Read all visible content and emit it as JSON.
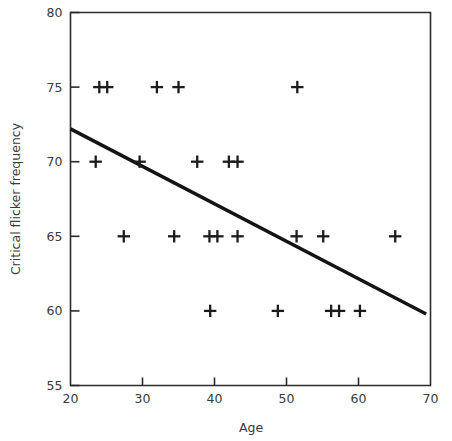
{
  "chart_data": {
    "type": "scatter",
    "title": "",
    "xlabel": "Age",
    "ylabel": "Critical flicker frequency",
    "xlim": [
      20,
      70
    ],
    "ylim": [
      55,
      80
    ],
    "xticks": [
      20,
      30,
      40,
      50,
      60,
      70
    ],
    "xtick_labels": [
      "20",
      "30",
      "40",
      "50",
      "60",
      "70"
    ],
    "yticks": [
      55,
      60,
      65,
      70,
      75,
      80
    ],
    "ytick_labels": [
      "55",
      "60",
      "65",
      "70",
      "75",
      "80"
    ],
    "grid": false,
    "legend": null,
    "marker": "plus",
    "marker_color": "#1c1c1c",
    "line_color": "#141414",
    "points": [
      {
        "x": 24.0,
        "y": 75
      },
      {
        "x": 25.1,
        "y": 75
      },
      {
        "x": 32.0,
        "y": 75
      },
      {
        "x": 35.0,
        "y": 75
      },
      {
        "x": 51.5,
        "y": 75
      },
      {
        "x": 23.5,
        "y": 70
      },
      {
        "x": 29.6,
        "y": 70
      },
      {
        "x": 37.6,
        "y": 70
      },
      {
        "x": 42.0,
        "y": 70
      },
      {
        "x": 43.2,
        "y": 70
      },
      {
        "x": 27.4,
        "y": 65
      },
      {
        "x": 34.4,
        "y": 65
      },
      {
        "x": 39.3,
        "y": 65
      },
      {
        "x": 40.4,
        "y": 65
      },
      {
        "x": 43.2,
        "y": 65
      },
      {
        "x": 51.4,
        "y": 65
      },
      {
        "x": 55.1,
        "y": 65
      },
      {
        "x": 65.1,
        "y": 65
      },
      {
        "x": 39.4,
        "y": 60
      },
      {
        "x": 48.8,
        "y": 60
      },
      {
        "x": 56.2,
        "y": 60
      },
      {
        "x": 57.3,
        "y": 60
      },
      {
        "x": 60.2,
        "y": 60
      }
    ],
    "fit_line": {
      "x_start": 20.0,
      "y_start": 72.2,
      "x_end": 69.4,
      "y_end": 59.8
    }
  }
}
